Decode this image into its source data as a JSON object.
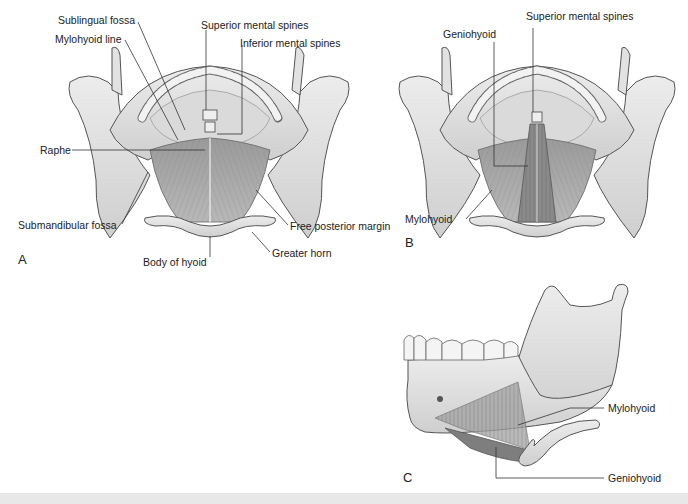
{
  "figure": {
    "panels": [
      {
        "id": "A",
        "letter": "A",
        "labels": {
          "sublingual_fossa": "Sublingual fossa",
          "mylohyoid_line": "Mylohyoid line",
          "superior_mental_spines": "Superior mental spines",
          "inferior_mental_spines": "Inferior mental spines",
          "raphe": "Raphe",
          "submandibular_fossa": "Submandibular fossa",
          "free_posterior_margin": "Free posterior margin",
          "body_of_hyoid": "Body of hyoid",
          "greater_horn": "Greater horn"
        }
      },
      {
        "id": "B",
        "letter": "B",
        "labels": {
          "geniohyoid": "Geniohyoid",
          "superior_mental_spines": "Superior mental spines",
          "mylohyoid": "Mylohyoid"
        }
      },
      {
        "id": "C",
        "letter": "C",
        "labels": {
          "mylohyoid": "Mylohyoid",
          "geniohyoid": "Geniohyoid"
        }
      }
    ],
    "colors": {
      "bone": "#e4e4e4",
      "bone_shade": "#c9c9c9",
      "muscle": "#a8a8a8",
      "muscle_dark": "#8e8e8e",
      "outline": "#555555",
      "leader": "#333333"
    }
  }
}
